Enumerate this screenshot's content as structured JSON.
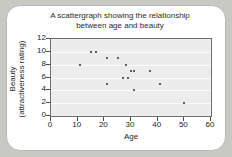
{
  "card": {
    "background": "#ffffff",
    "page_background": "#c9c9c4"
  },
  "chart_data": {
    "type": "scatter",
    "title": "A scattergraph showing the relationship between age and beauty",
    "title_line1": "A scattergraph showing the relationship",
    "title_line2": "between age and beauty",
    "xlabel": "Age",
    "ylabel": "Beauty (attractiveness rating)",
    "ylabel_line1": "Beauty",
    "ylabel_line2": "(attractiveness rating)",
    "xlim": [
      0,
      60
    ],
    "ylim": [
      0,
      12
    ],
    "xticks": [
      0,
      10,
      20,
      30,
      40,
      50,
      60
    ],
    "yticks": [
      0,
      2,
      4,
      6,
      8,
      10,
      12
    ],
    "xtick_labels": [
      "0",
      "10",
      "20",
      "30",
      "40",
      "50",
      "60"
    ],
    "ytick_labels": [
      "0",
      "2",
      "4",
      "6",
      "8",
      "10",
      "12"
    ],
    "grid": "horizontal",
    "legend": "none",
    "plot_background": "#ececec",
    "marker_color": "#5d5d5d",
    "points": [
      {
        "x": 11,
        "y": 8
      },
      {
        "x": 15,
        "y": 10
      },
      {
        "x": 17,
        "y": 10
      },
      {
        "x": 21,
        "y": 9
      },
      {
        "x": 21,
        "y": 5
      },
      {
        "x": 25,
        "y": 9
      },
      {
        "x": 28,
        "y": 8
      },
      {
        "x": 27,
        "y": 6
      },
      {
        "x": 29,
        "y": 6
      },
      {
        "x": 30,
        "y": 7
      },
      {
        "x": 31,
        "y": 7
      },
      {
        "x": 31,
        "y": 4
      },
      {
        "x": 37,
        "y": 7
      },
      {
        "x": 41,
        "y": 5
      },
      {
        "x": 50,
        "y": 2
      }
    ]
  }
}
